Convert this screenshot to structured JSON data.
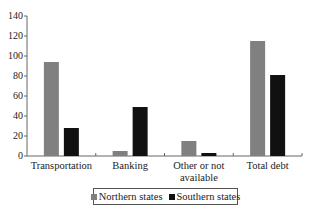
{
  "chart_data": {
    "type": "bar",
    "title": "",
    "xlabel": "",
    "ylabel": "",
    "ylim": [
      0,
      140
    ],
    "yticks": [
      0,
      20,
      40,
      60,
      80,
      100,
      120,
      140
    ],
    "grid": false,
    "legend_position": "bottom",
    "categories": [
      "Transportation",
      "Banking",
      "Other or not available",
      "Total debt"
    ],
    "category_labels": [
      [
        "Transportation"
      ],
      [
        "Banking"
      ],
      [
        "Other or not",
        "available"
      ],
      [
        "Total debt"
      ]
    ],
    "series": [
      {
        "name": "Northern states",
        "color": "#808080",
        "values": [
          94,
          5,
          15,
          115
        ]
      },
      {
        "name": "Southern states",
        "color": "#111111",
        "values": [
          28,
          49,
          3,
          81
        ]
      }
    ]
  },
  "legend": {
    "items": [
      {
        "label": "Northern states",
        "color": "#808080"
      },
      {
        "label": "Southern states",
        "color": "#111111"
      }
    ]
  }
}
